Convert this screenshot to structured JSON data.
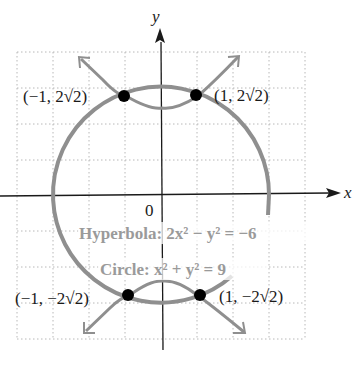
{
  "figure": {
    "axes": {
      "x_label": "x",
      "y_label": "y",
      "origin_label": "0"
    },
    "equations": {
      "hyperbola": "Hyperbola: 2x² − y² = −6",
      "circle": "Circle: x² + y² = 9"
    },
    "points": [
      {
        "label": "(−1, 2√2)",
        "x": -1,
        "y": 2.828
      },
      {
        "label": "(1, 2√2)",
        "x": 1,
        "y": 2.828
      },
      {
        "label": "(−1, −2√2)",
        "x": -1,
        "y": -2.828
      },
      {
        "label": "(1, −2√2)",
        "x": 1,
        "y": -2.828
      }
    ],
    "colors": {
      "curve": "#8f8f8f",
      "axis": "#1a1a1a",
      "grid": "#b8b8b8",
      "point": "#000000"
    }
  }
}
